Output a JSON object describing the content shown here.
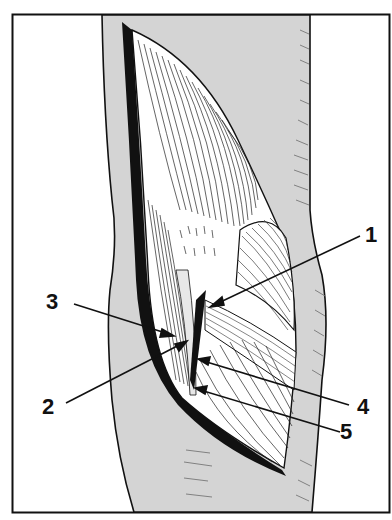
{
  "figure": {
    "type": "anatomical-illustration",
    "colors": {
      "background": "#ffffff",
      "skin": "#d4d4d4",
      "ink": "#111111",
      "muscle": "#ffffff"
    }
  },
  "labels": [
    {
      "id": "1",
      "text": "1",
      "x": 365,
      "y": 230,
      "target": [
        212,
        306
      ]
    },
    {
      "id": "2",
      "text": "2",
      "x": 44,
      "y": 400,
      "target": [
        185,
        342
      ]
    },
    {
      "id": "3",
      "text": "3",
      "x": 48,
      "y": 296,
      "target": [
        172,
        335
      ]
    },
    {
      "id": "4",
      "text": "4",
      "x": 358,
      "y": 398,
      "target": [
        200,
        360
      ]
    },
    {
      "id": "5",
      "text": "5",
      "x": 340,
      "y": 424,
      "target": [
        197,
        389
      ]
    }
  ]
}
